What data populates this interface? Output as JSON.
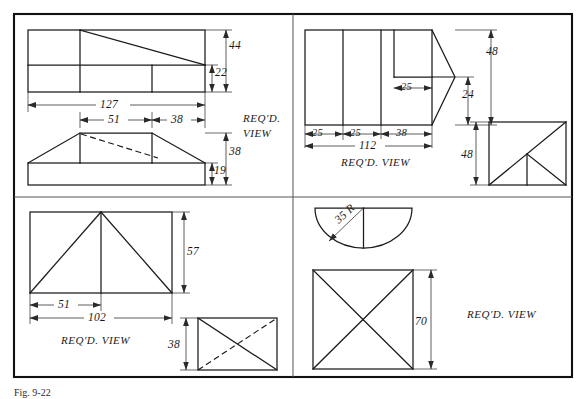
{
  "sheet": {
    "title": "Required View Exercises",
    "caption": "Fig. 9-22",
    "line_color": "#1a1a1a",
    "dim_color": "#2a2a2a",
    "background": "#ffffff",
    "frame_color": "#111111"
  },
  "problems": [
    {
      "id": "problem-top-left",
      "quadrant": "top-left",
      "view_label": "REQ'D.",
      "view_label_line2": "VIEW",
      "dimensions": [
        {
          "name": "height-upper-total",
          "value": "44"
        },
        {
          "name": "height-upper-lower",
          "value": "22"
        },
        {
          "name": "length-overall",
          "value": "127"
        },
        {
          "name": "length-plateau",
          "value": "51"
        },
        {
          "name": "length-right-slope",
          "value": "38"
        },
        {
          "name": "height-front-total",
          "value": "38"
        },
        {
          "name": "height-front-base",
          "value": "19"
        }
      ]
    },
    {
      "id": "problem-top-right",
      "quadrant": "top-right",
      "view_label": "REQ'D. VIEW",
      "dimensions": [
        {
          "name": "height-total",
          "value": "48"
        },
        {
          "name": "height-point",
          "value": "24"
        },
        {
          "name": "notch-depth",
          "value": "25"
        },
        {
          "name": "segment-1",
          "value": "25"
        },
        {
          "name": "segment-2",
          "value": "25"
        },
        {
          "name": "segment-3",
          "value": "38"
        },
        {
          "name": "length-overall",
          "value": "112"
        },
        {
          "name": "side-height",
          "value": "48"
        }
      ]
    },
    {
      "id": "problem-bottom-left",
      "quadrant": "bottom-left",
      "view_label": "REQ'D. VIEW",
      "dimensions": [
        {
          "name": "height-front",
          "value": "57"
        },
        {
          "name": "apex-offset",
          "value": "51"
        },
        {
          "name": "length-overall",
          "value": "102"
        },
        {
          "name": "depth-top",
          "value": "38"
        }
      ]
    },
    {
      "id": "problem-bottom-right",
      "quadrant": "bottom-right",
      "view_label": "REQ'D. VIEW",
      "dimensions": [
        {
          "name": "radius",
          "value": "35 R"
        },
        {
          "name": "height-front",
          "value": "70"
        }
      ]
    }
  ]
}
